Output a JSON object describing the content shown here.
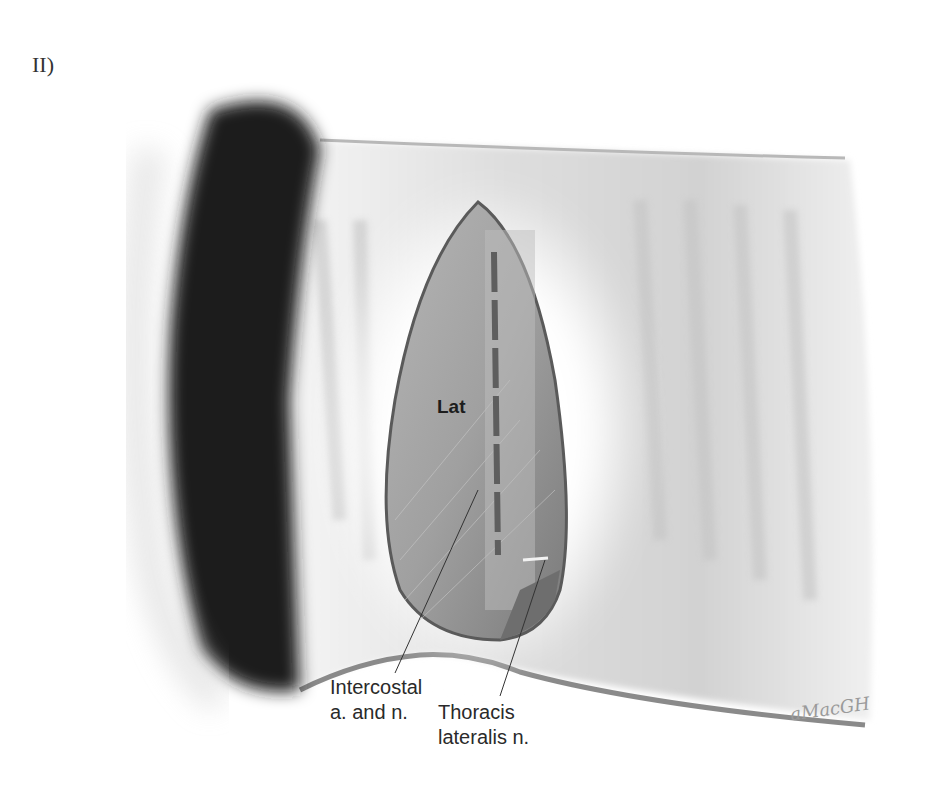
{
  "figure": {
    "panel_label": "II)",
    "structures": {
      "muscle_label": "Lat"
    },
    "annotations": [
      {
        "id": "intercostal",
        "line1": "Intercostal",
        "line2": "a. and n."
      },
      {
        "id": "thoracis",
        "line1": "Thoracis",
        "line2": "lateralis n."
      }
    ],
    "signature": "aMacGH",
    "colors": {
      "hair": "#1a1a1a",
      "skin": "#e6e6e6",
      "muscle": "#8f8f8f",
      "vessel": "#5e5e5e",
      "outline": "#6a6a6a"
    }
  }
}
